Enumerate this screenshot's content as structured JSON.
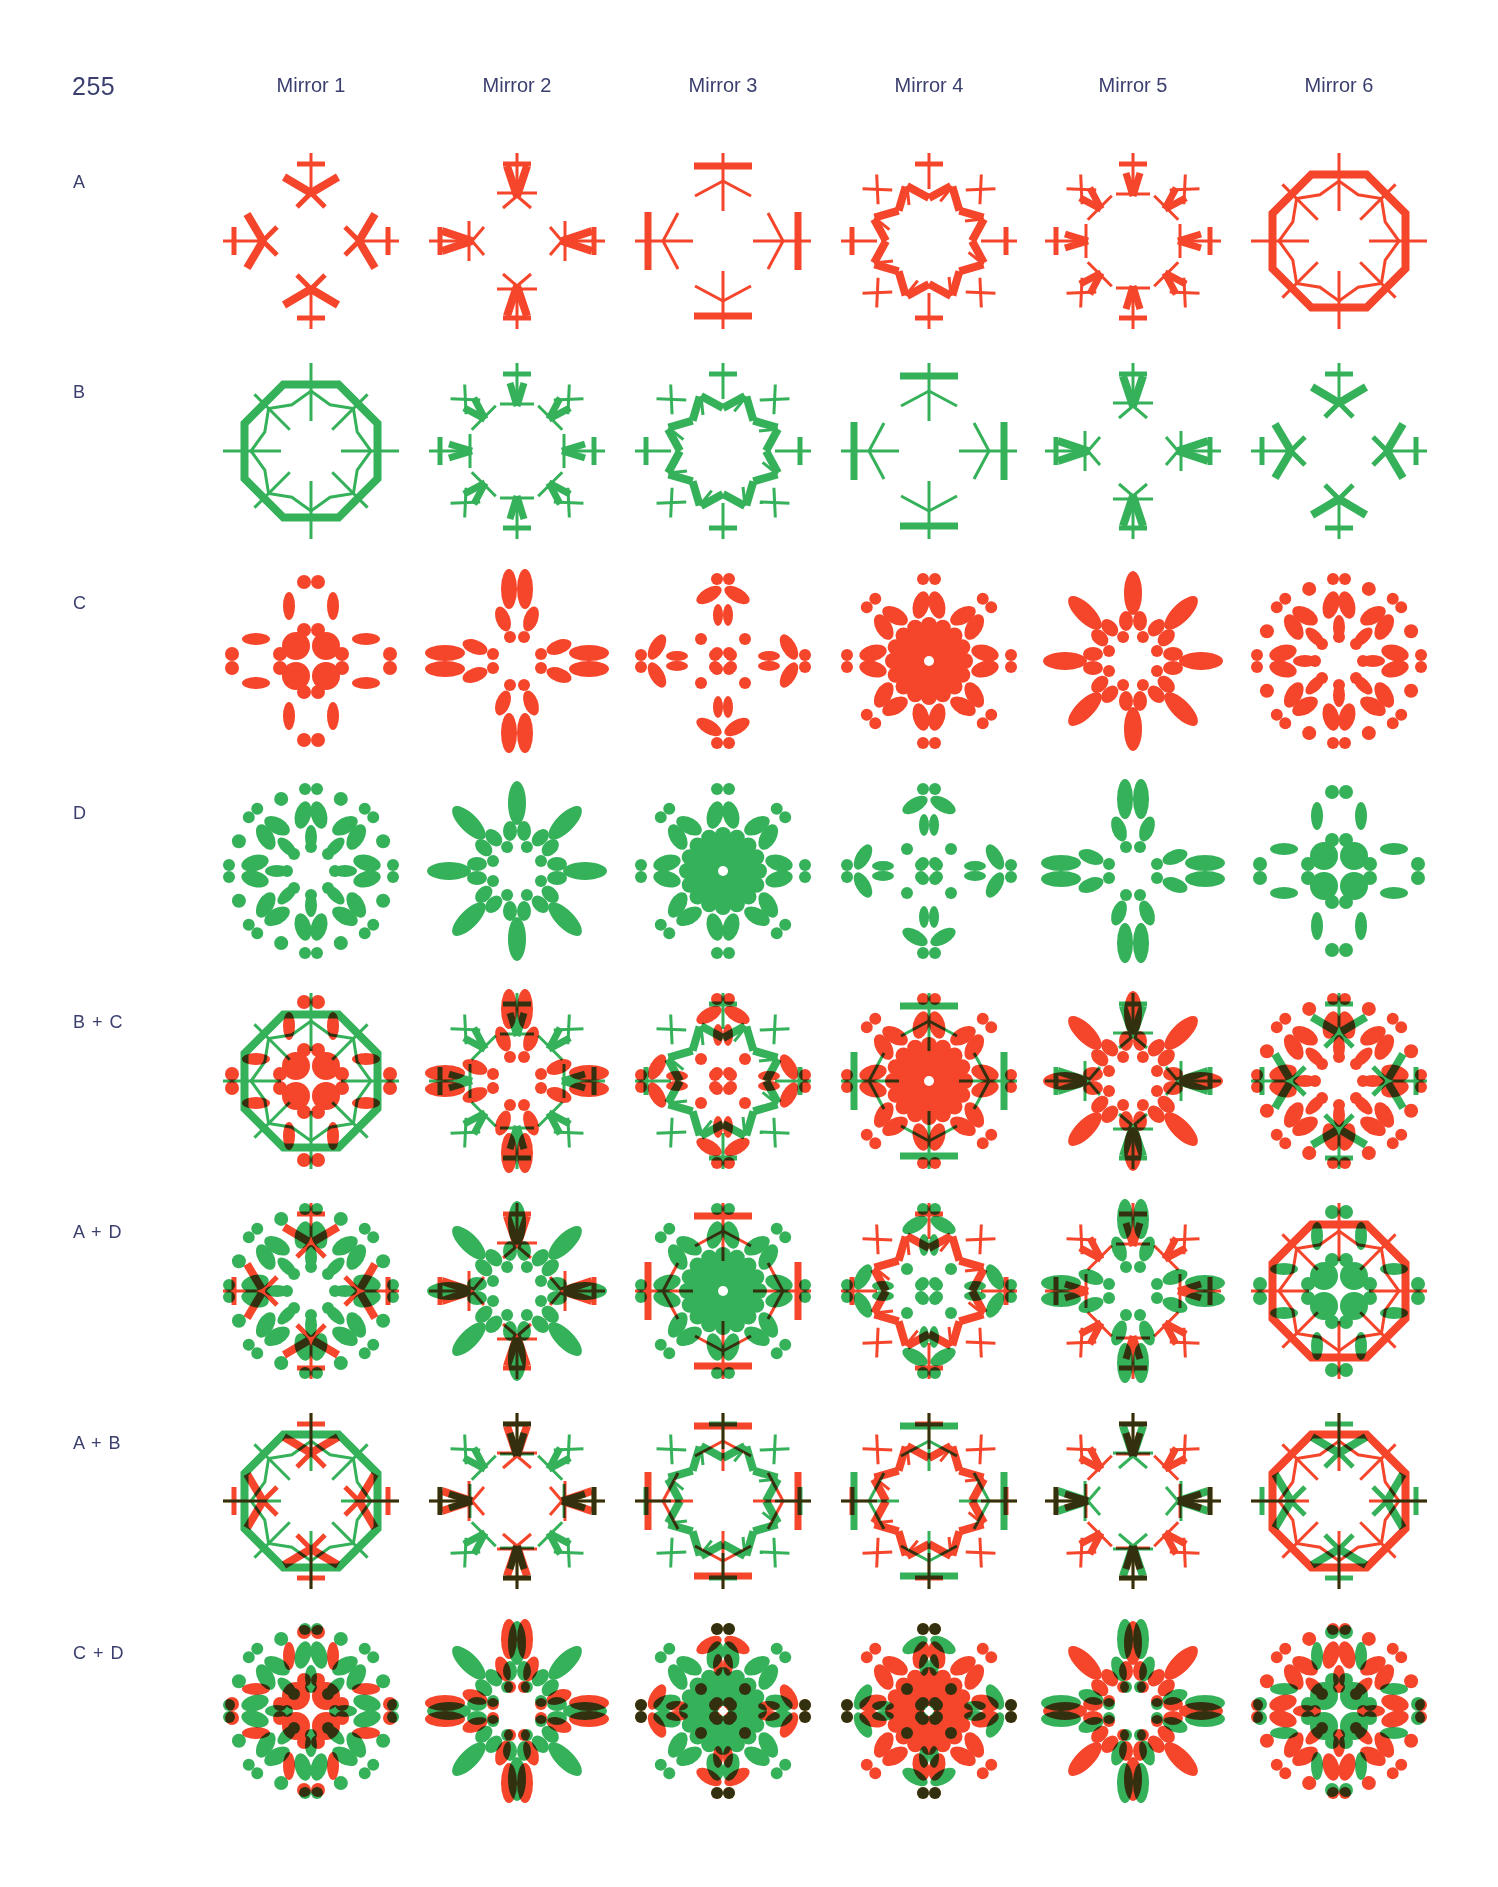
{
  "page": {
    "number": "255"
  },
  "colors": {
    "red": "#f5452b",
    "green": "#35b15a",
    "overlap": "#3b1c17",
    "text": "#3a3f6e"
  },
  "columns": [
    {
      "label": "Mirror 1"
    },
    {
      "label": "Mirror 2"
    },
    {
      "label": "Mirror 3"
    },
    {
      "label": "Mirror 4"
    },
    {
      "label": "Mirror 5"
    },
    {
      "label": "Mirror 6"
    }
  ],
  "rows": [
    {
      "label": "A",
      "layers": [
        {
          "motif": "lines",
          "color": "red",
          "variants": [
            1,
            2,
            3,
            4,
            5,
            6
          ]
        }
      ]
    },
    {
      "label": "B",
      "layers": [
        {
          "motif": "lines",
          "color": "green",
          "variants": [
            6,
            5,
            4,
            3,
            2,
            1
          ]
        }
      ]
    },
    {
      "label": "C",
      "layers": [
        {
          "motif": "dots",
          "color": "red",
          "variants": [
            1,
            2,
            3,
            4,
            5,
            6
          ]
        }
      ]
    },
    {
      "label": "D",
      "layers": [
        {
          "motif": "dots",
          "color": "green",
          "variants": [
            6,
            5,
            4,
            3,
            2,
            1
          ]
        }
      ]
    },
    {
      "label": "B + C",
      "layers": [
        {
          "motif": "lines",
          "color": "green",
          "variants": [
            6,
            5,
            4,
            3,
            2,
            1
          ]
        },
        {
          "motif": "dots",
          "color": "red",
          "variants": [
            1,
            2,
            3,
            4,
            5,
            6
          ]
        }
      ]
    },
    {
      "label": "A + D",
      "layers": [
        {
          "motif": "dots",
          "color": "green",
          "variants": [
            6,
            5,
            4,
            3,
            2,
            1
          ]
        },
        {
          "motif": "lines",
          "color": "red",
          "variants": [
            1,
            2,
            3,
            4,
            5,
            6
          ]
        }
      ]
    },
    {
      "label": "A + B",
      "layers": [
        {
          "motif": "lines",
          "color": "green",
          "variants": [
            6,
            5,
            4,
            3,
            2,
            1
          ]
        },
        {
          "motif": "lines",
          "color": "red",
          "variants": [
            1,
            2,
            3,
            4,
            5,
            6
          ]
        }
      ]
    },
    {
      "label": "C + D",
      "layers": [
        {
          "motif": "dots",
          "color": "green",
          "variants": [
            6,
            5,
            4,
            3,
            2,
            1
          ]
        },
        {
          "motif": "dots",
          "color": "red",
          "variants": [
            1,
            2,
            3,
            4,
            5,
            6
          ]
        }
      ]
    }
  ]
}
